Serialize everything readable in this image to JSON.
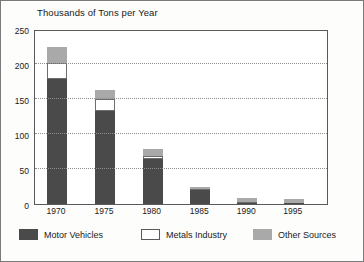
{
  "chart_data": {
    "type": "bar",
    "subtype": "stacked-bar",
    "title": "Thousands of Tons per Year",
    "xlabel": "",
    "ylabel": "",
    "ylim": [
      0,
      250
    ],
    "yticks": [
      0,
      50,
      100,
      150,
      200,
      250
    ],
    "ytick_labels": [
      "0",
      "50",
      "100",
      "150",
      "200",
      "250"
    ],
    "grid": true,
    "grid_style": "dotted-horizontal",
    "grid_values": [
      50,
      100,
      150,
      200
    ],
    "legend_position": "bottom",
    "categories": [
      "1970",
      "1975",
      "1980",
      "1985",
      "1990",
      "1995"
    ],
    "series": [
      {
        "name": "Motor Vehicles",
        "color": "#4a4a4a",
        "values": [
          178,
          133,
          65,
          20,
          2,
          1
        ]
      },
      {
        "name": "Metals Industry",
        "color": "#ffffff",
        "values": [
          23,
          17,
          4,
          1,
          1,
          1
        ]
      },
      {
        "name": "Other Sources",
        "color": "#a9a9a9",
        "values": [
          24,
          13,
          10,
          4,
          5,
          5
        ]
      }
    ],
    "totals": [
      225,
      163,
      79,
      25,
      8,
      7
    ]
  },
  "legend": {
    "items": [
      {
        "label": "Motor Vehicles",
        "swatch": "dark-gray-swatch"
      },
      {
        "label": "Metals Industry",
        "swatch": "white-swatch"
      },
      {
        "label": "Other Sources",
        "swatch": "light-gray-swatch"
      }
    ]
  },
  "colors": {
    "motor_vehicles": "#4a4a4a",
    "metals_industry": "#ffffff",
    "other_sources": "#a9a9a9",
    "frame": "#5a5a5a",
    "grid": "#8e8e8e",
    "text": "#1a1a1a",
    "page_background": "#fdfdfb"
  }
}
